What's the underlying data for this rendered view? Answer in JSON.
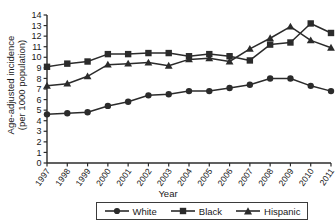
{
  "chart_data": {
    "type": "line",
    "title": "",
    "xlabel": "Year",
    "ylabel_line1": "Age-adjusted incidence",
    "ylabel_line2": "(per 1000 population)",
    "categories": [
      "1997",
      "1998",
      "1999",
      "2000",
      "2001",
      "2002",
      "2003",
      "2004",
      "2005",
      "2006",
      "2007",
      "2008",
      "2009",
      "2010",
      "2011"
    ],
    "ylim": [
      0,
      14
    ],
    "yticks": [
      0,
      1,
      2,
      3,
      4,
      5,
      6,
      7,
      8,
      9,
      10,
      11,
      12,
      13,
      14
    ],
    "grid": false,
    "legend_position": "bottom",
    "series": [
      {
        "name": "White",
        "marker": "circle",
        "color": "#2b2b2b",
        "values": [
          4.6,
          4.7,
          4.8,
          5.4,
          5.8,
          6.4,
          6.5,
          6.8,
          6.8,
          7.1,
          7.4,
          8.0,
          8.0,
          7.3,
          6.8
        ]
      },
      {
        "name": "Black",
        "marker": "square",
        "color": "#2b2b2b",
        "values": [
          9.1,
          9.4,
          9.6,
          10.3,
          10.3,
          10.4,
          10.4,
          10.1,
          10.3,
          10.1,
          9.7,
          11.2,
          11.4,
          13.2,
          12.3
        ]
      },
      {
        "name": "Hispanic",
        "marker": "triangle",
        "color": "#2b2b2b",
        "values": [
          7.3,
          7.5,
          8.2,
          9.3,
          9.4,
          9.5,
          9.2,
          9.8,
          9.9,
          9.6,
          10.8,
          11.8,
          12.9,
          11.6,
          10.9
        ]
      }
    ]
  },
  "legend": {
    "items": [
      {
        "label": "White",
        "marker": "circle"
      },
      {
        "label": "Black",
        "marker": "square"
      },
      {
        "label": "Hispanic",
        "marker": "triangle"
      }
    ]
  }
}
